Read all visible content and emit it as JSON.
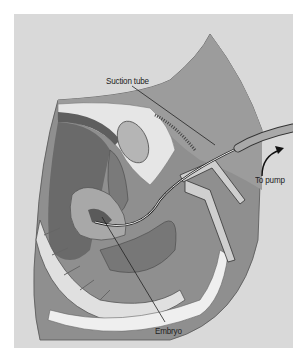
{
  "figure": {
    "type": "medical-illustration",
    "labels": {
      "suction_tube": "Suction tube",
      "to_pump": "To pump",
      "embryo": "Embryo"
    },
    "colors": {
      "background": "#d9d9d9",
      "body_tissue": "#8a8a8a",
      "dark_tissue": "#5e5e5e",
      "light_tissue": "#ededed",
      "outline": "#333333"
    }
  }
}
